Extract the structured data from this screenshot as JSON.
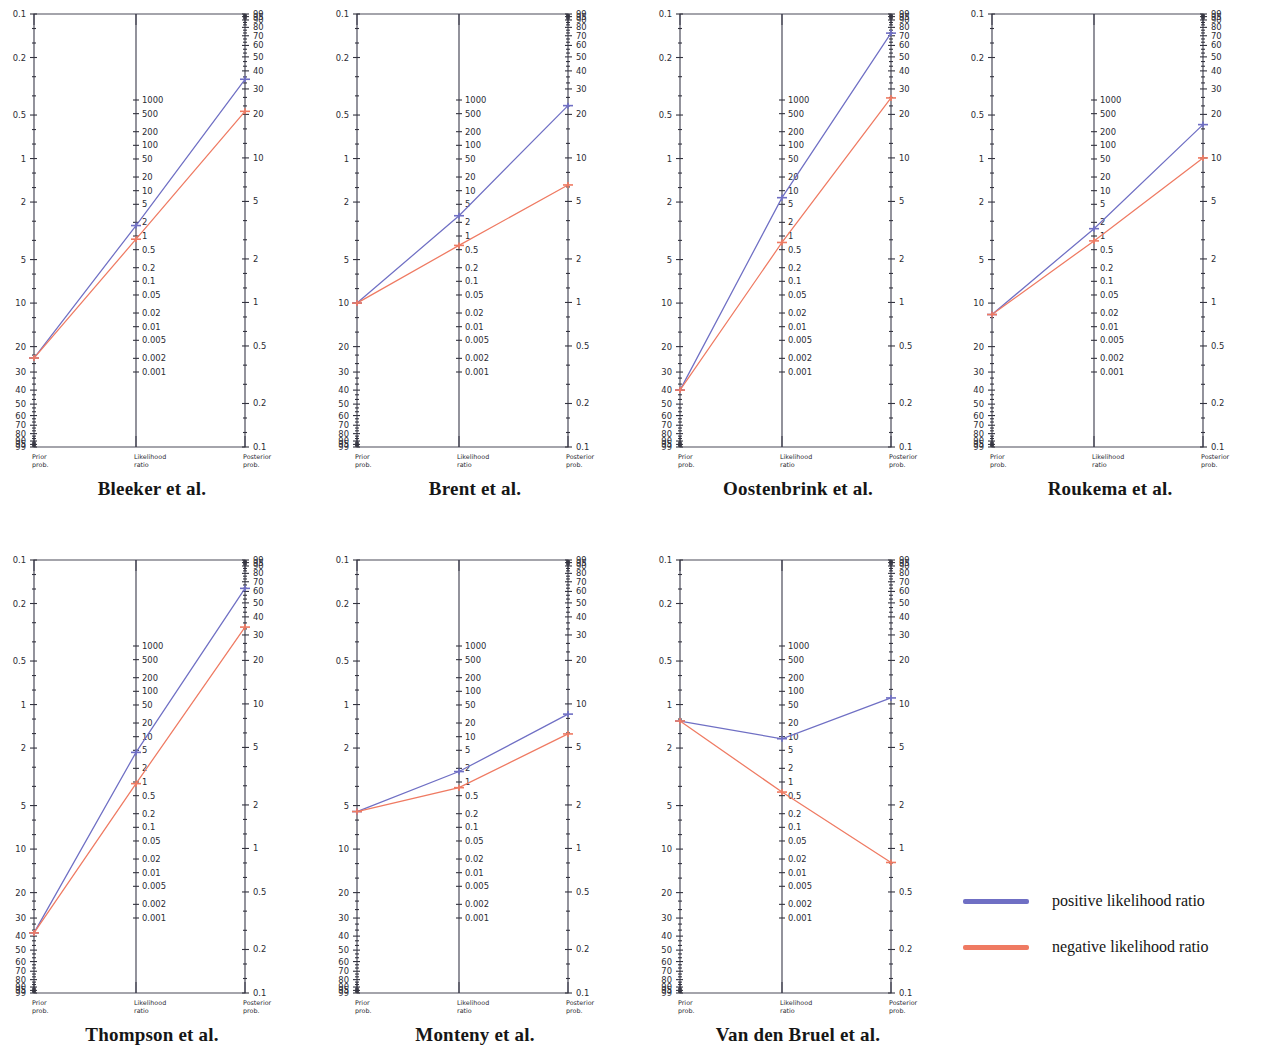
{
  "figure": {
    "type": "fagan-nomogram-grid",
    "rows": 2,
    "columns": 4
  },
  "axes": {
    "left": {
      "caption_line1": "Prior",
      "caption_line2": "prob.",
      "name": "prior probability",
      "unit": "%",
      "direction": "descending",
      "ticks": [
        "0.1",
        "0.2",
        "0.5",
        "1",
        "2",
        "5",
        "10",
        "20",
        "30",
        "40",
        "50",
        "60",
        "70",
        "80",
        "90",
        "95",
        "99"
      ],
      "tick_values": [
        0.1,
        0.2,
        0.5,
        1,
        2,
        5,
        10,
        20,
        30,
        40,
        50,
        60,
        70,
        80,
        90,
        95,
        99
      ]
    },
    "center": {
      "caption_line1": "Likelihood",
      "caption_line2": "ratio",
      "name": "likelihood ratio",
      "unit": "",
      "direction": "descending",
      "ticks": [
        "1000",
        "500",
        "200",
        "100",
        "50",
        "20",
        "10",
        "5",
        "2",
        "1",
        "0.5",
        "0.2",
        "0.1",
        "0.05",
        "0.02",
        "0.01",
        "0.005",
        "0.002",
        "0.001"
      ],
      "tick_values": [
        1000,
        500,
        200,
        100,
        50,
        20,
        10,
        5,
        2,
        1,
        0.5,
        0.2,
        0.1,
        0.05,
        0.02,
        0.01,
        0.005,
        0.002,
        0.001
      ]
    },
    "right": {
      "caption_line1": "Posterior",
      "caption_line2": "prob.",
      "name": "posterior probability",
      "unit": "%",
      "direction": "ascending",
      "ticks": [
        "99",
        "95",
        "90",
        "80",
        "70",
        "60",
        "50",
        "40",
        "30",
        "20",
        "10",
        "5",
        "2",
        "1",
        "0.5",
        "0.2",
        "0.1"
      ],
      "tick_values": [
        99,
        95,
        90,
        80,
        70,
        60,
        50,
        40,
        30,
        20,
        10,
        5,
        2,
        1,
        0.5,
        0.2,
        0.1
      ]
    }
  },
  "legend": {
    "position": "bottom-right",
    "items": [
      {
        "label": "positive likelihood ratio",
        "color": "#6f6fc4",
        "key": "positive"
      },
      {
        "label": "negative likelihood ratio",
        "color": "#ef7a62",
        "key": "negative"
      }
    ]
  },
  "chart_data": {
    "type": "line",
    "title": "",
    "xlabel": "",
    "ylabel": "",
    "panels": [
      {
        "title": "Bleeker et al.",
        "row": 0,
        "col": 0,
        "prior_prob": 24,
        "series": [
          {
            "name": "positive likelihood ratio",
            "lr": 1.7,
            "posterior_prob": 35,
            "color": "#6f6fc4"
          },
          {
            "name": "negative likelihood ratio",
            "lr": 0.85,
            "posterior_prob": 21,
            "color": "#ef7a62"
          }
        ]
      },
      {
        "title": "Brent et al.",
        "row": 0,
        "col": 1,
        "prior_prob": 10,
        "series": [
          {
            "name": "positive likelihood ratio",
            "lr": 2.8,
            "posterior_prob": 23,
            "color": "#6f6fc4"
          },
          {
            "name": "negative likelihood ratio",
            "lr": 0.62,
            "posterior_prob": 6.5,
            "color": "#ef7a62"
          }
        ]
      },
      {
        "title": "Oostenbrink et al.",
        "row": 0,
        "col": 2,
        "prior_prob": 40,
        "series": [
          {
            "name": "positive likelihood ratio",
            "lr": 7.0,
            "posterior_prob": 73,
            "color": "#6f6fc4"
          },
          {
            "name": "negative likelihood ratio",
            "lr": 0.72,
            "posterior_prob": 26,
            "color": "#ef7a62"
          }
        ]
      },
      {
        "title": "Roukema et al.",
        "row": 0,
        "col": 3,
        "prior_prob": 12,
        "series": [
          {
            "name": "positive likelihood ratio",
            "lr": 1.45,
            "posterior_prob": 17,
            "color": "#6f6fc4"
          },
          {
            "name": "negative likelihood ratio",
            "lr": 0.78,
            "posterior_prob": 10,
            "color": "#ef7a62"
          }
        ]
      },
      {
        "title": "Thompson  et al.",
        "row": 1,
        "col": 0,
        "prior_prob": 38,
        "series": [
          {
            "name": "positive likelihood ratio",
            "lr": 4.5,
            "posterior_prob": 63,
            "color": "#6f6fc4"
          },
          {
            "name": "negative likelihood ratio",
            "lr": 0.92,
            "posterior_prob": 34,
            "color": "#ef7a62"
          }
        ]
      },
      {
        "title": "Monteny  et al.",
        "row": 1,
        "col": 1,
        "prior_prob": 5.5,
        "series": [
          {
            "name": "positive likelihood ratio",
            "lr": 1.7,
            "posterior_prob": 8.5,
            "color": "#6f6fc4"
          },
          {
            "name": "negative likelihood ratio",
            "lr": 0.75,
            "posterior_prob": 6.2,
            "color": "#ef7a62"
          }
        ]
      },
      {
        "title": "Van den Bruel et al.",
        "row": 1,
        "col": 2,
        "prior_prob": 1.3,
        "series": [
          {
            "name": "positive likelihood ratio",
            "lr": 9.0,
            "posterior_prob": 11,
            "color": "#6f6fc4"
          },
          {
            "name": "negative likelihood ratio",
            "lr": 0.6,
            "posterior_prob": 0.8,
            "color": "#ef7a62"
          }
        ]
      }
    ]
  }
}
